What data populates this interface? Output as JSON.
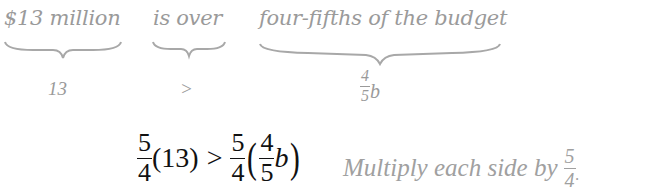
{
  "labels": {
    "phrase1": "$13 million",
    "phrase2": "is over",
    "phrase3": "four-fifths of the budget"
  },
  "translations": {
    "value1": "13",
    "value2": ">",
    "value3": {
      "numerator": "4",
      "denominator": "5",
      "variable": "b"
    }
  },
  "equation": {
    "left_coeff": {
      "numerator": "5",
      "denominator": "4"
    },
    "left_paren": "(13)",
    "operator": ">",
    "right_coeff": {
      "numerator": "5",
      "denominator": "4"
    },
    "open_paren": "(",
    "inner_frac": {
      "numerator": "4",
      "denominator": "5"
    },
    "variable": "b",
    "close_paren": ")"
  },
  "note": {
    "text": "Multiply each side by",
    "frac": {
      "numerator": "5",
      "denominator": "4"
    },
    "punct": "."
  }
}
